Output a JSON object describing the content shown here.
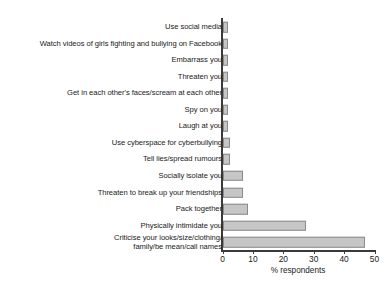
{
  "chart_data": {
    "type": "bar",
    "orientation": "horizontal",
    "title": "",
    "xlabel": "% respondents",
    "ylabel": "",
    "xlim": [
      0,
      50
    ],
    "xticks": [
      0,
      10,
      20,
      30,
      40,
      50
    ],
    "grid": false,
    "legend": null,
    "bar_color": "#c6c6c6",
    "bar_edge_color": "#8a8a8a",
    "axis_color": "#3a3a3a",
    "categories": [
      "Use social media",
      "Watch videos of girls fighting and bullying on Facebook",
      "Embarrass you",
      "Threaten you",
      "Get in each other's faces/scream at each other",
      "Spy on you",
      "Laugh at you",
      "Use cyberspace for cyberbullying",
      "Tell lies/spread rumours",
      "Socially isolate you",
      "Threaten to break up your friendships",
      "Pack together",
      "Physically intimidate you",
      "Criticise your looks/size/clothing/\nfamily/be mean/call names"
    ],
    "values": [
      1.9,
      1.9,
      1.9,
      1.9,
      1.9,
      1.9,
      1.9,
      2.4,
      2.6,
      6.7,
      6.7,
      8.4,
      27.5,
      47.0
    ]
  }
}
